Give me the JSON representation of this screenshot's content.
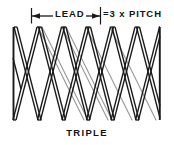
{
  "figure": {
    "caption": "TRIPLE",
    "dimension": {
      "lead_label": "LEAD",
      "pitch_label": "=3 x PITCH"
    },
    "colors": {
      "background": "#ffffff",
      "line_front": "#1a1a1a",
      "line_back": "#9a9a9a",
      "text": "#141414"
    },
    "geometry": {
      "left_edge_x": 13,
      "right_edge_x": 160,
      "crest_top_y": 27,
      "root_bottom_y": 120,
      "peak_count": 7,
      "valley_count": 7,
      "pitch_px": 24.5,
      "lead_start_x": 31,
      "lead_end_x": 100,
      "dim_line_y": 16,
      "tick_top_y": 8,
      "tick_bottom_y": 23
    }
  }
}
